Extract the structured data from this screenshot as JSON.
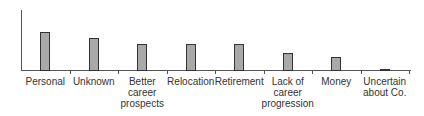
{
  "chart_data": {
    "type": "bar",
    "title": "",
    "xlabel": "",
    "ylabel": "",
    "categories": [
      "Personal",
      "Unknown",
      "Better\ncareer\nprospects",
      "Relocation",
      "Retirement",
      "Lack of\ncareer\nprogression",
      "Money",
      "Uncertain\nabout Co."
    ],
    "values": [
      39,
      33,
      27,
      27,
      27,
      18,
      14,
      2
    ],
    "ylim": [
      0,
      60
    ],
    "grid": false,
    "legend": null,
    "colors": {
      "bar_fill": "#a9a9a9",
      "bar_border": "#333333",
      "axis": "#555555"
    }
  }
}
